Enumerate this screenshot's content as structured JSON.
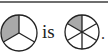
{
  "diagram": {
    "left_circle": {
      "parts": 3,
      "shaded": [
        0
      ],
      "fill": "#a9a9a9"
    },
    "connector_text": "is",
    "right_circle": {
      "parts": 6,
      "shaded": [
        0
      ],
      "fill": "#a9a9a9"
    },
    "end_punctuation": "."
  },
  "colors": {
    "stroke": "#222222",
    "shade": "#a9a9a9",
    "border": "#6e6e6e"
  }
}
